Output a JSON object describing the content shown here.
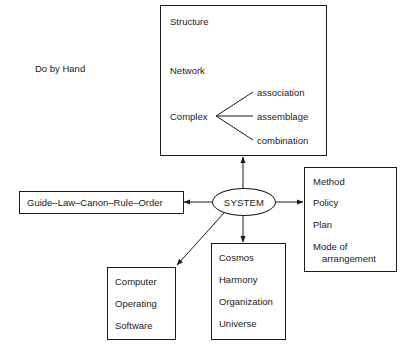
{
  "canvas": {
    "width": 403,
    "height": 351,
    "background": "#ffffff",
    "stroke": "#1b1b1b"
  },
  "annotations": {
    "do_by_hand": "Do by Hand"
  },
  "nodes": {
    "concepts_box": {
      "name": "concepts-box",
      "items": [
        "Structure",
        "Network",
        "Complex"
      ],
      "branches": [
        "association",
        "assemblage",
        "combination"
      ]
    },
    "system": {
      "label": "SYSTEM"
    },
    "rule_box": {
      "label": "Guide–Law–Canon–Rule–Order"
    },
    "method_box": {
      "items": [
        "Method",
        "Policy",
        "Plan"
      ],
      "wrapped_item": {
        "first": "Mode of",
        "second": "arrangement"
      }
    },
    "cosmos_box": {
      "items": [
        "Cosmos",
        "Harmony",
        "Organization",
        "Universe"
      ]
    },
    "computer_box": {
      "items": [
        "Computer",
        "Operating",
        "Software"
      ]
    }
  }
}
